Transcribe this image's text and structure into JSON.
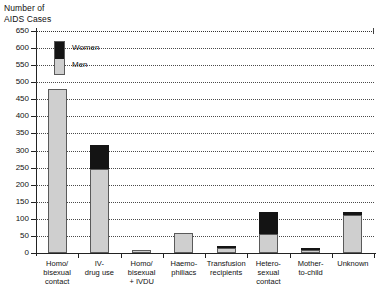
{
  "chart_data": {
    "type": "bar",
    "title": "",
    "ylabel": "Number of\nAIDS Cases",
    "xlabel": "",
    "ylim": [
      0,
      650
    ],
    "ytick_step": 50,
    "yticks": [
      0,
      50,
      100,
      150,
      200,
      250,
      300,
      350,
      400,
      450,
      500,
      550,
      600,
      650
    ],
    "grid": true,
    "stacked": true,
    "legend_position": "upper-left-inside",
    "categories": [
      "Homo/\nbisexual\ncontact",
      "IV-\ndrug use",
      "Homo/\nbisexual\n+ IVDU",
      "Haemo-\nphiliacs",
      "Transfusion\nrecipients",
      "Hetero-\nsexual\ncontact",
      "Mother-\nto-child",
      "Unknown"
    ],
    "series": [
      {
        "name": "Men",
        "color": "#cfcfcf",
        "values": [
          480,
          245,
          9,
          60,
          14,
          55,
          8,
          110
        ]
      },
      {
        "name": "Women",
        "color": "#141414",
        "values": [
          0,
          70,
          0,
          0,
          7,
          65,
          5,
          10
        ]
      }
    ],
    "totals": [
      480,
      315,
      9,
      60,
      21,
      120,
      13,
      120
    ]
  },
  "legend": {
    "women_label": "Women",
    "men_label": "Men"
  },
  "axis": {
    "y_title": "Number of\nAIDS Cases",
    "tick_labels": [
      "0",
      "50",
      "100",
      "150",
      "200",
      "250",
      "300",
      "350",
      "400",
      "450",
      "500",
      "550",
      "600",
      "650"
    ]
  }
}
